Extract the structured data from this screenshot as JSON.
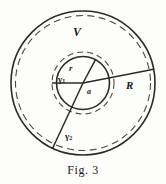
{
  "figure": {
    "caption": "Fig. 3",
    "labels": {
      "outer_region": "V",
      "inner_radius": "r",
      "outer_radius": "R",
      "inner_gap": "a",
      "contour_1_base": "γ",
      "contour_1_sub": "1",
      "contour_2_base": "γ",
      "contour_2_sub": "2"
    },
    "colors": {
      "ink": "#1b1b1b",
      "stroke": "#2b2b2b",
      "dash": "#4a4a4a",
      "background": "#fdfdfc"
    },
    "geometry": {
      "center_x": 83,
      "center_y": 83,
      "outer_solid_radius": 72,
      "outer_dashed_radius": 67,
      "inner_solid_radius": 27,
      "inner_dashed_radius": 31,
      "radial_line_r_angle_deg": -62,
      "radial_line_R_angle_deg": -11,
      "radial_line_gamma2_angle_deg": 118,
      "radial_line_horizontal_angle_deg": 180
    }
  }
}
